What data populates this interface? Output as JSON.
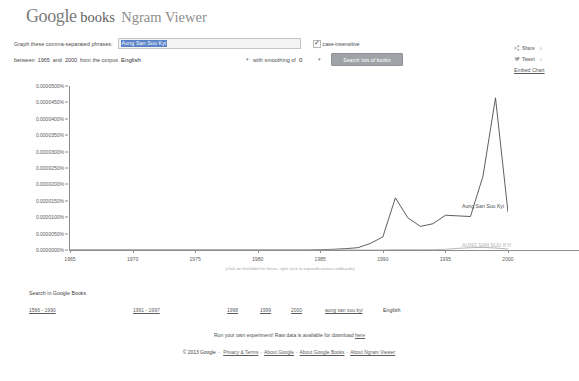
{
  "header": {
    "logo_goog": "Google",
    "logo_books": "books",
    "logo_ngram": "Ngram Viewer"
  },
  "form": {
    "phrases_label": "Graph these comma-separated phrases:",
    "phrases_value": "Aung San Suu Kyi",
    "phrases_placeholder": "Enter comma-separated phrases",
    "case_insensitive_label": "case-insensitive",
    "case_insensitive_checked": "✓",
    "between_label": "between",
    "year_start": "1965",
    "and_label": "and",
    "year_end": "2000",
    "corpus_label": "from the corpus",
    "corpus_value": "English",
    "smoothing_label": "with smoothing of",
    "smoothing_value": "0",
    "search_button": "Search lots of books",
    "caret": "▾"
  },
  "share": {
    "share_icon": "share-icon",
    "share_label": "Share",
    "share_count": "0",
    "tweet_icon": "twitter-bird-icon",
    "tweet_label": "Tweet",
    "tweet_count": "0",
    "embed_label": "Embed Chart"
  },
  "chart_data": {
    "type": "line",
    "title": "",
    "xlabel": "",
    "ylabel": "",
    "xlim": [
      1965,
      2000
    ],
    "ylim": [
      0.0,
      5e-05
    ],
    "grid": false,
    "note": "(click on line/label for focus, right click to expand/contract wildcards)",
    "ytick_labels": [
      "0.0000500%",
      "0.0000450%",
      "0.0000400%",
      "0.0000350%",
      "0.0000300%",
      "0.0000250%",
      "0.0000200%",
      "0.0000150%",
      "0.0000100%",
      "0.0000050%",
      "0.0000000%"
    ],
    "ytick_values": [
      5e-05,
      4.5e-05,
      4e-05,
      3.5e-05,
      3e-05,
      2.5e-05,
      2e-05,
      1.5e-05,
      1e-05,
      5e-06,
      0.0
    ],
    "xtick_labels": [
      "1965",
      "1970",
      "1975",
      "1980",
      "1985",
      "1990",
      "1995",
      "2000"
    ],
    "xtick_values": [
      1965,
      1970,
      1975,
      1980,
      1985,
      1990,
      1995,
      2000
    ],
    "x": [
      1965,
      1966,
      1967,
      1968,
      1969,
      1970,
      1971,
      1972,
      1973,
      1974,
      1975,
      1976,
      1977,
      1978,
      1979,
      1980,
      1981,
      1982,
      1983,
      1984,
      1985,
      1986,
      1987,
      1988,
      1989,
      1990,
      1991,
      1992,
      1993,
      1994,
      1995,
      1996,
      1997,
      1998,
      1999,
      2000
    ],
    "series": [
      {
        "name": "Aung San Suu Kyi",
        "color": "#4d4d4d",
        "label_position": "right",
        "values": [
          0.0,
          0.0,
          0.0,
          0.0,
          0.0,
          0.0,
          0.0,
          0.0,
          0.0,
          0.0,
          0.0,
          0.0,
          0.0,
          0.0,
          0.0,
          0.0,
          0.0,
          0.0,
          0.0,
          0.0,
          1e-07,
          2e-07,
          4e-07,
          7e-07,
          2e-06,
          4e-06,
          1.59e-05,
          9.8e-06,
          7.2e-06,
          8e-06,
          1.06e-05,
          1.04e-05,
          1.02e-05,
          2.25e-05,
          4.64e-05,
          1.15e-05
        ]
      },
      {
        "name": "AUNG SAN SUU KYI",
        "color": "#aeaeae",
        "label_position": "right",
        "values": [
          0.0,
          0.0,
          0.0,
          0.0,
          0.0,
          0.0,
          0.0,
          0.0,
          0.0,
          0.0,
          0.0,
          0.0,
          0.0,
          0.0,
          0.0,
          0.0,
          0.0,
          0.0,
          0.0,
          0.0,
          0.0,
          0.0,
          0.0,
          0.0,
          0.0,
          0.0,
          1e-07,
          1e-07,
          1e-07,
          1e-07,
          2e-07,
          5e-07,
          7e-07,
          8e-07,
          6e-07,
          3e-07
        ]
      }
    ]
  },
  "google_books": {
    "title": "Search in Google Books",
    "links": [
      {
        "label": "1566 - 1990",
        "x": 0
      },
      {
        "label": "1991 - 1997",
        "x": 104
      },
      {
        "label": "1998",
        "x": 198
      },
      {
        "label": "1999",
        "x": 231
      },
      {
        "label": "2000",
        "x": 262
      },
      {
        "label": "aung san suu kyi",
        "x": 296
      }
    ],
    "corpus_language": "English"
  },
  "footer": {
    "experiment_text": "Run your own experiment! Raw data is available for download ",
    "experiment_link": "here",
    "copyright": "© 2013 Google",
    "legal_links": [
      "Privacy & Terms",
      "About Google",
      "About Google Books",
      "About Ngram Viewer"
    ],
    "dash": "-"
  }
}
